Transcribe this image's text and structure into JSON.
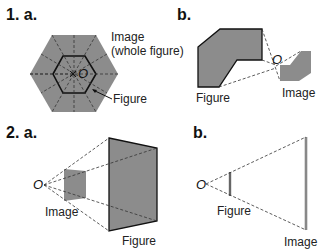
{
  "panels": {
    "p1a": {
      "label": "1. a.",
      "captions": {
        "image": "Image",
        "image_sub": "(whole figure)",
        "figure": "Figure"
      },
      "origin": "O"
    },
    "p1b": {
      "label": "b.",
      "captions": {
        "figure": "Figure",
        "image": "Image"
      },
      "origin": "O"
    },
    "p2a": {
      "label": "2. a.",
      "captions": {
        "image": "Image",
        "figure": "Figure"
      },
      "origin": "O"
    },
    "p2b": {
      "label": "b.",
      "captions": {
        "figure": "Figure",
        "image": "Image"
      },
      "origin": "O"
    }
  },
  "colors": {
    "shape_fill": "#8c8c8c",
    "outline": "#111111",
    "dash": "#333333",
    "thin_bar": "#777777"
  }
}
